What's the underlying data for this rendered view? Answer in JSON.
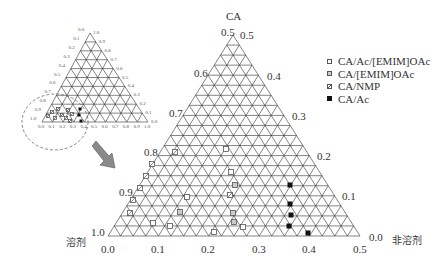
{
  "diagram": {
    "type": "ternary",
    "apex_label": "CA",
    "bottom_left_label": "溶剂",
    "bottom_right_label": "非溶剂",
    "main": {
      "left_axis_ticks": [
        "0.5",
        "0.6",
        "0.7",
        "0.8",
        "0.9",
        "1.0"
      ],
      "right_axis_ticks": [
        "0.5",
        "0.4",
        "0.3",
        "0.2",
        "0.1",
        "0.0"
      ],
      "bottom_axis_ticks": [
        "0.0",
        "0.1",
        "0.2",
        "0.3",
        "0.4",
        "0.5"
      ],
      "grid_divisions": 20
    },
    "inset": {
      "left_axis_ticks": [
        "0.0",
        "0.1",
        "0.2",
        "0.3",
        "0.4",
        "0.5",
        "0.6",
        "0.7",
        "0.8",
        "0.9",
        "1.0"
      ],
      "right_axis_ticks": [
        "1.0",
        "0.9",
        "0.8",
        "0.7",
        "0.6",
        "0.5",
        "0.4",
        "0.3",
        "0.2",
        "0.1",
        "0.0"
      ],
      "bottom_axis_ticks": [
        "0.0",
        "0.1",
        "0.2",
        "0.3",
        "0.4",
        "0.5",
        "0.6",
        "0.7",
        "0.8",
        "0.9",
        "1.0"
      ],
      "grid_divisions": 10
    },
    "legend": [
      {
        "label": "CA/Ac/[EMIM]OAc",
        "marker": "open-square"
      },
      {
        "label": "CA/[EMIM]OAc",
        "marker": "half-square"
      },
      {
        "label": "CA/NMP",
        "marker": "diag-square"
      },
      {
        "label": "CA/Ac",
        "marker": "filled-square"
      }
    ],
    "colors": {
      "grid": "#333333",
      "arrow": "#888888",
      "filled_marker": "#111111"
    }
  }
}
